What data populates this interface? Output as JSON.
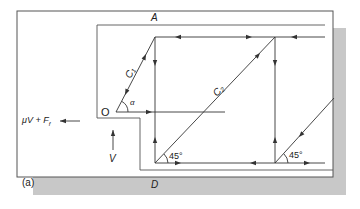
{
  "figure": {
    "panel_label": "(a)",
    "labels": {
      "point_a": "A",
      "point_d": "D",
      "origin": "O",
      "alpha": "α",
      "c1": "C₁",
      "c2": "C₂",
      "angle_left": "45°",
      "angle_right": "45°",
      "force_left": "μV + F",
      "force_left_sub": "f",
      "force_v": "V"
    },
    "colors": {
      "line": "#333333",
      "frame": "#555555",
      "shadow": "#c8c8c8",
      "background": "#ffffff"
    }
  }
}
